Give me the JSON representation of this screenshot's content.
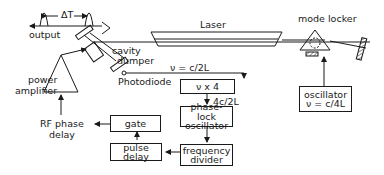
{
  "diagram": {
    "colors": {
      "stroke": "#1a1a1a",
      "background": "#ffffff"
    },
    "labels": {
      "delta_t": "ΔT",
      "output": "output",
      "laser": "Laser",
      "mode_locker": "mode locker",
      "cavity_dumper_line1": "cavity",
      "cavity_dumper_line2": "dumper",
      "photodiode": "Photodiode",
      "power_amplifier_line1": "power",
      "power_amplifier_line2": "amplifier",
      "rf_phase_delay_line1": "RF phase",
      "rf_phase_delay_line2": "delay",
      "freq_c2l": "ν = c/2L",
      "freq_4c2l": "4c/2L"
    },
    "boxes": {
      "multiplier": {
        "line1": "ν x 4"
      },
      "phase_lock": {
        "line1": "phase-lock",
        "line2": "oscillator"
      },
      "freq_divider": {
        "line1": "frequency",
        "line2": "divider"
      },
      "gate": {
        "line1": "gate"
      },
      "pulse_delay": {
        "line1": "pulse delay"
      },
      "oscillator": {
        "line1": "oscillator",
        "line2": "ν = c/4L"
      }
    }
  }
}
